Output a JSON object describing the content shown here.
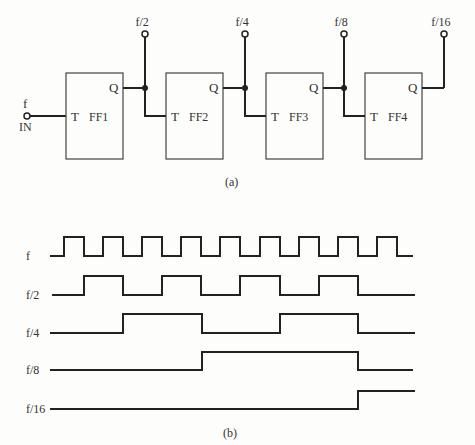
{
  "circuit": {
    "input": {
      "label_top": "f",
      "label_bottom": "IN"
    },
    "flipflops": [
      {
        "name": "FF1",
        "t_label": "T",
        "q_label": "Q",
        "x": 66
      },
      {
        "name": "FF2",
        "t_label": "T",
        "q_label": "Q",
        "x": 166
      },
      {
        "name": "FF3",
        "t_label": "T",
        "q_label": "Q",
        "x": 266
      },
      {
        "name": "FF4",
        "t_label": "T",
        "q_label": "Q",
        "x": 365
      }
    ],
    "outputs": [
      {
        "label": "f/2",
        "x": 145
      },
      {
        "label": "f/4",
        "x": 245
      },
      {
        "label": "f/8",
        "x": 344
      },
      {
        "label": "f/16",
        "x": 444
      }
    ],
    "caption": "(a)"
  },
  "timing": {
    "signals": [
      {
        "label": "f",
        "base_y": 256,
        "high_y": 237,
        "start_x": 50,
        "end_x": 413,
        "edges": [
          64,
          84,
          103,
          123,
          142,
          162,
          181,
          201,
          220,
          240,
          260,
          280,
          299,
          319,
          338,
          358,
          377,
          397
        ],
        "initial": 0
      },
      {
        "label": "f/2",
        "base_y": 295,
        "high_y": 276,
        "start_x": 52,
        "end_x": 415,
        "edges": [
          84,
          123,
          162,
          201,
          240,
          280,
          319,
          358
        ],
        "initial": 0
      },
      {
        "label": "f/4",
        "base_y": 333,
        "high_y": 314,
        "start_x": 50,
        "end_x": 415,
        "edges": [
          123,
          202,
          280,
          358
        ],
        "initial": 0
      },
      {
        "label": "f/8",
        "base_y": 370,
        "high_y": 352,
        "start_x": 50,
        "end_x": 413,
        "edges": [
          202,
          358
        ],
        "initial": 0
      },
      {
        "label": "f/16",
        "base_y": 409,
        "high_y": 391,
        "start_x": 50,
        "end_x": 415,
        "edges": [
          358
        ],
        "initial": 0
      }
    ],
    "caption": "(b)"
  }
}
